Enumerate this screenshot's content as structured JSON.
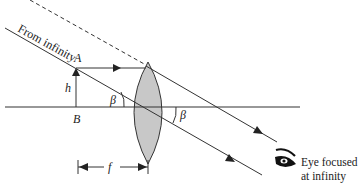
{
  "diagram": {
    "labels": {
      "from_infinity": "From infinity",
      "point_a": "A",
      "point_b": "B",
      "height": "h",
      "angle_left": "β",
      "angle_right": "β",
      "focal_length": "f",
      "eye_line1": "Eye focused",
      "eye_line2": "at infinity"
    },
    "colors": {
      "lens_fill": "#c8c8c8",
      "line": "#222222"
    }
  }
}
